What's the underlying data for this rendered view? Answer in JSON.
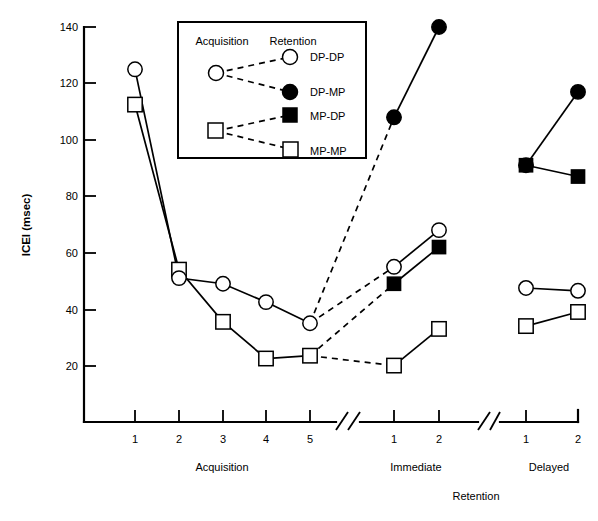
{
  "chart_data": {
    "type": "line",
    "title": "",
    "xlabel": "Retention",
    "ylabel": "ICEI (msec)",
    "ylim": [
      0,
      140
    ],
    "yticks": [
      0,
      20,
      40,
      60,
      80,
      100,
      120,
      140
    ],
    "ytick_labels": [
      "",
      "20",
      "40",
      "60",
      "80",
      "100",
      "120",
      "140"
    ],
    "grid": false,
    "legend_position": "upper-center-inside",
    "legend_headers": [
      "Acquisition",
      "Retention"
    ],
    "axis_breaks": 2,
    "x_groups": [
      {
        "name": "Acquisition",
        "ticks": [
          "1",
          "2",
          "3",
          "4",
          "5"
        ]
      },
      {
        "name": "Immediate",
        "ticks": [
          "1",
          "2"
        ]
      },
      {
        "name": "Delayed",
        "ticks": [
          "1",
          "2"
        ]
      }
    ],
    "series": [
      {
        "name": "DP-DP",
        "marker": "open-circle",
        "acquisition": [
          125,
          51,
          49,
          42.5,
          35
        ],
        "immediate": [
          55,
          68
        ],
        "delayed": [
          47.5,
          46.5
        ],
        "link_style_acq_to_immediate": "dashed",
        "link_style_within": "solid"
      },
      {
        "name": "DP-MP",
        "marker": "filled-circle",
        "acquisition": [
          125,
          51,
          49,
          42.5,
          35
        ],
        "immediate": [
          108,
          140
        ],
        "delayed": [
          91,
          117
        ],
        "link_style_acq_to_immediate": "dashed",
        "link_style_within": "solid"
      },
      {
        "name": "MP-DP",
        "marker": "filled-square",
        "acquisition": [
          112.5,
          54,
          35.5,
          22.5,
          23.5
        ],
        "immediate": [
          49,
          62
        ],
        "delayed": [
          91,
          87
        ],
        "link_style_acq_to_immediate": "dashed",
        "link_style_within": "solid"
      },
      {
        "name": "MP-MP",
        "marker": "open-square",
        "acquisition": [
          112.5,
          54,
          35.5,
          22.5,
          23.5
        ],
        "immediate": [
          20,
          33
        ],
        "delayed": [
          34,
          39
        ],
        "link_style_acq_to_immediate": "dashed",
        "link_style_within": "solid"
      }
    ]
  },
  "axis": {
    "y_title": "ICEI (msec)",
    "x_title": "Retention",
    "y_labels": [
      "140",
      "120",
      "100",
      "80",
      "60",
      "40",
      "20"
    ],
    "acq_ticks": [
      "1",
      "2",
      "3",
      "4",
      "5"
    ],
    "imm_ticks": [
      "1",
      "2"
    ],
    "del_ticks": [
      "1",
      "2"
    ],
    "group_acquisition": "Acquisition",
    "group_immediate": "Immediate",
    "group_delayed": "Delayed"
  },
  "legend": {
    "header_left": "Acquisition",
    "header_right": "Retention",
    "items": [
      {
        "label": "DP-DP",
        "marker": "open-circle"
      },
      {
        "label": "DP-MP",
        "marker": "filled-circle"
      },
      {
        "label": "MP-DP",
        "marker": "filled-square"
      },
      {
        "label": "MP-MP",
        "marker": "open-square"
      }
    ]
  },
  "colors": {
    "ink": "#000000",
    "paper": "#ffffff"
  }
}
